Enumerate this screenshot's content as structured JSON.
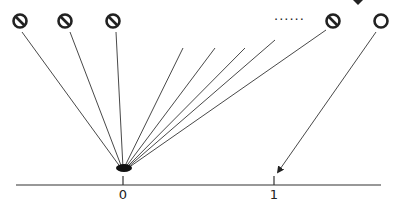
{
  "diagram": {
    "axis": {
      "ticks": [
        {
          "label": "0",
          "x": 123
        },
        {
          "label": "1",
          "x": 274
        }
      ]
    },
    "sources": [
      {
        "symbol": "prohibited-circle",
        "x": 16,
        "y": 20,
        "target_x": 123
      },
      {
        "symbol": "prohibited-circle",
        "x": 64,
        "y": 20,
        "target_x": 123
      },
      {
        "symbol": "prohibited-circle",
        "x": 113,
        "y": 20,
        "target_x": 123
      },
      {
        "symbol": "prohibited-circle",
        "x": 332,
        "y": 20,
        "target_x": 123
      },
      {
        "symbol": "open-circle",
        "x": 382,
        "y": 20,
        "target_x": 274
      }
    ],
    "ellipsis": "......",
    "colors": {
      "stroke": "#222222",
      "background": "#ffffff"
    }
  }
}
